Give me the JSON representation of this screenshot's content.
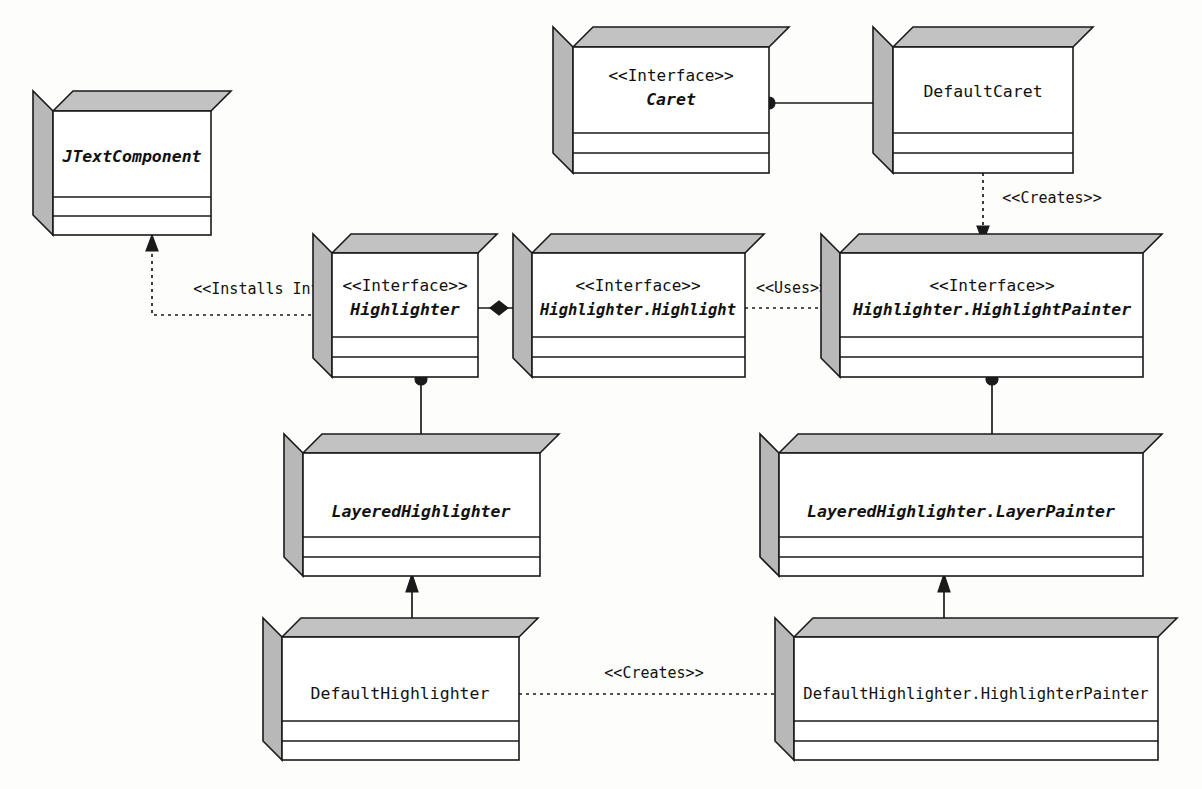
{
  "diagram": {
    "type": "uml-class-diagram",
    "background_color": "#fdfdfb",
    "box_fill_color": "#ffffff",
    "box_shade_color": "#c2c2c2",
    "line_color": "#1a1a1a"
  },
  "classes": [
    {
      "id": "jtextcomponent",
      "stereotype": "",
      "name": "JTextComponent",
      "italic": true,
      "x": 53,
      "y": 111,
      "w": 158,
      "h": 124,
      "depth": 20
    },
    {
      "id": "caret",
      "stereotype": "<<Interface>>",
      "name": "Caret",
      "italic": true,
      "x": 573,
      "y": 47,
      "w": 196,
      "h": 126,
      "depth": 20
    },
    {
      "id": "defaultcaret",
      "stereotype": "",
      "name": "DefaultCaret",
      "italic": false,
      "x": 893,
      "y": 47,
      "w": 180,
      "h": 126,
      "depth": 20
    },
    {
      "id": "highlighter",
      "stereotype": "<<Interface>>",
      "name": "Highlighter",
      "italic": true,
      "x": 332,
      "y": 253,
      "w": 146,
      "h": 124,
      "depth": 19
    },
    {
      "id": "highlighter-highlight",
      "stereotype": "<<Interface>>",
      "name": "Highlighter.Highlight",
      "italic": true,
      "x": 532,
      "y": 253,
      "w": 213,
      "h": 124,
      "depth": 19
    },
    {
      "id": "highlighter-highlightpainter",
      "stereotype": "<<Interface>>",
      "name": "Highlighter.HighlightPainter",
      "italic": true,
      "x": 840,
      "y": 253,
      "w": 303,
      "h": 124,
      "depth": 19
    },
    {
      "id": "layeredhighlighter",
      "stereotype": "",
      "name": "LayeredHighlighter",
      "italic": true,
      "x": 303,
      "y": 453,
      "w": 237,
      "h": 123,
      "depth": 19
    },
    {
      "id": "layeredhighlighter-layerpainter",
      "stereotype": "",
      "name": "LayeredHighlighter.LayerPainter",
      "italic": true,
      "x": 779,
      "y": 453,
      "w": 364,
      "h": 123,
      "depth": 19
    },
    {
      "id": "defaulthighlighter",
      "stereotype": "",
      "name": "DefaultHighlighter",
      "italic": false,
      "x": 282,
      "y": 637,
      "w": 237,
      "h": 123,
      "depth": 19
    },
    {
      "id": "defaulthighlighter-highlighterpainter",
      "stereotype": "",
      "name": "DefaultHighlighter.HighlighterPainter",
      "italic": false,
      "x": 794,
      "y": 637,
      "w": 364,
      "h": 123,
      "depth": 19
    }
  ],
  "relationships": [
    {
      "id": "rel-installs-into",
      "label": "<<Installs Into>>",
      "kind": "dependency-dashed-open-arrow",
      "from": "highlighter",
      "to": "jtextcomponent",
      "label_x": 270,
      "label_y": 289
    },
    {
      "id": "rel-caret-defaultcaret",
      "label": "",
      "kind": "association-filled-dot",
      "from": "caret",
      "to": "defaultcaret"
    },
    {
      "id": "rel-defaultcaret-creates",
      "label": "<<Creates>>",
      "kind": "dependency-dashed-open-arrow",
      "from": "defaultcaret",
      "to": "highlighter-highlightpainter",
      "label_x": 1052,
      "label_y": 198
    },
    {
      "id": "rel-highlighter-composition",
      "label": "",
      "kind": "composition-filled-diamond",
      "from": "highlighter",
      "to": "highlighter-highlight"
    },
    {
      "id": "rel-uses",
      "label": "<<Uses>>",
      "kind": "dependency-dashed-open-arrow",
      "from": "highlighter-highlight",
      "to": "highlighter-highlightpainter",
      "label_x": 792,
      "label_y": 288
    },
    {
      "id": "rel-highlighter-layered",
      "label": "",
      "kind": "association-filled-dot",
      "from": "highlighter",
      "to": "layeredhighlighter"
    },
    {
      "id": "rel-painter-layerpainter",
      "label": "",
      "kind": "association-filled-dot",
      "from": "highlighter-highlightpainter",
      "to": "layeredhighlighter-layerpainter"
    },
    {
      "id": "rel-layered-default",
      "label": "",
      "kind": "generalization-solid-arrow",
      "from": "defaulthighlighter",
      "to": "layeredhighlighter"
    },
    {
      "id": "rel-layerpainter-highlighterpainter",
      "label": "",
      "kind": "generalization-solid-arrow",
      "from": "defaulthighlighter-highlighterpainter",
      "to": "layeredhighlighter-layerpainter"
    },
    {
      "id": "rel-defaulthighlighter-creates",
      "label": "<<Creates>>",
      "kind": "dependency-dashed-open-arrow",
      "from": "defaulthighlighter",
      "to": "defaulthighlighter-highlighterpainter",
      "label_x": 654,
      "label_y": 673
    }
  ]
}
